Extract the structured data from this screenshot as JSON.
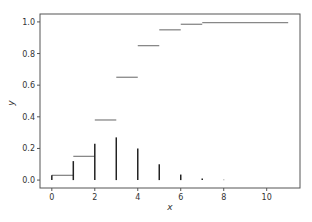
{
  "chart_data": {
    "type": "line",
    "title": "",
    "xlabel": "x",
    "ylabel": "y",
    "xlim": [
      -0.55,
      11.55
    ],
    "ylim": [
      -0.05,
      1.05
    ],
    "grid": false,
    "legend": null,
    "x_ticks": [
      0,
      2,
      4,
      6,
      8,
      10
    ],
    "y_ticks": [
      0.0,
      0.2,
      0.4,
      0.6,
      0.8,
      1.0
    ],
    "x_tick_labels": [
      "0",
      "2",
      "4",
      "6",
      "8",
      "10"
    ],
    "y_tick_labels": [
      "0.0",
      "0.2",
      "0.4",
      "0.6",
      "0.8",
      "1.0"
    ],
    "series": [
      {
        "name": "pmf",
        "style": "vlines",
        "color": "#222222",
        "x": [
          0,
          1,
          2,
          3,
          4,
          5,
          6,
          7,
          8
        ],
        "values": [
          0.03,
          0.12,
          0.23,
          0.27,
          0.2,
          0.1,
          0.035,
          0.01,
          0.002
        ]
      },
      {
        "name": "cdf",
        "style": "hlines",
        "color": "#888888",
        "x_start": [
          0,
          1,
          2,
          3,
          4,
          5,
          6,
          7
        ],
        "x_end": [
          1,
          2,
          3,
          4,
          5,
          6,
          7,
          11
        ],
        "values": [
          0.03,
          0.15,
          0.38,
          0.65,
          0.85,
          0.95,
          0.985,
          0.995
        ]
      }
    ]
  }
}
